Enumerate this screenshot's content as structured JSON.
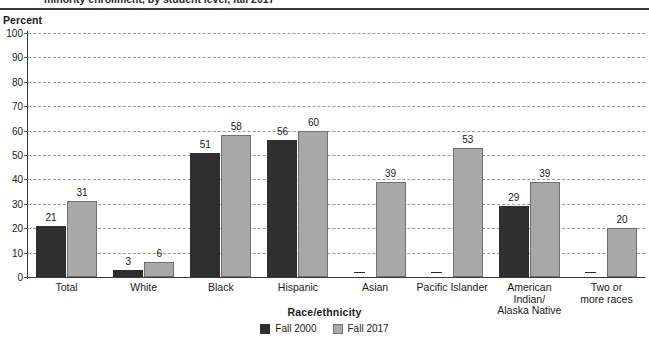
{
  "title": "minority enrollment, by student level, fall 2017",
  "axis_unit_label": "Percent",
  "legend": {
    "series": [
      {
        "label": "Fall 2000",
        "color": "#2f2f2f"
      },
      {
        "label": "Fall 2017",
        "color": "#a9a9a9"
      }
    ]
  },
  "chart_data": {
    "type": "bar",
    "title": "minority enrollment, by student level, fall 2017",
    "xlabel": "Race/ethnicity",
    "ylabel": "Percent",
    "ylim": [
      0,
      100
    ],
    "ytick_labels": [
      "0",
      "10",
      "20",
      "30",
      "40",
      "50",
      "60",
      "70",
      "80",
      "90",
      "100"
    ],
    "yticks": [
      0,
      10,
      20,
      30,
      40,
      50,
      60,
      70,
      80,
      90,
      100
    ],
    "grid": true,
    "legend_position": "bottom-center",
    "missing_value_marker": "—",
    "categories": [
      "Total",
      "White",
      "Black",
      "Hispanic",
      "Asian",
      "Pacific Islander",
      "American Indian/ Alaska Native",
      "Two or more races"
    ],
    "category_lines": [
      [
        "Total"
      ],
      [
        "White"
      ],
      [
        "Black"
      ],
      [
        "Hispanic"
      ],
      [
        "Asian"
      ],
      [
        "Pacific Islander"
      ],
      [
        "American",
        "Indian/",
        "Alaska Native"
      ],
      [
        "Two or",
        "more races"
      ]
    ],
    "series": [
      {
        "name": "Fall 2000",
        "values": [
          21,
          3,
          51,
          56,
          null,
          null,
          29,
          null
        ],
        "labels": [
          "21",
          "3",
          "51",
          "56",
          "—",
          "—",
          "29",
          "—"
        ]
      },
      {
        "name": "Fall 2017",
        "values": [
          31,
          6,
          58,
          60,
          39,
          53,
          39,
          20
        ],
        "labels": [
          "31",
          "6",
          "58",
          "60",
          "39",
          "53",
          "39",
          "20"
        ]
      }
    ]
  }
}
